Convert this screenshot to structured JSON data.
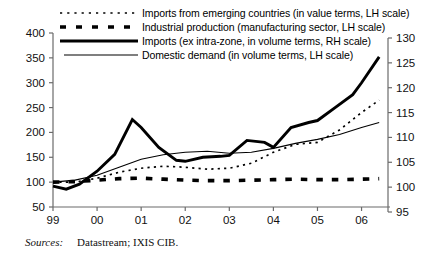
{
  "figure": {
    "source_label": "Sources:",
    "source_value": "Datastream; IXIS CIB."
  },
  "legend": {
    "items": [
      {
        "style": "dotted",
        "label": "Imports from emerging countries (in value terms, LH scale)"
      },
      {
        "style": "dashed",
        "label": "Industrial production (manufacturing sector, LH scale)"
      },
      {
        "style": "thick-solid",
        "label": "Imports (ex intra-zone, in volume terms, RH scale)"
      },
      {
        "style": "thin-solid",
        "label": "Domestic demand (in volume terms, LH scale)"
      }
    ]
  },
  "chart_data": {
    "type": "line",
    "title": "",
    "xlabel": "",
    "ylabel": "",
    "grid": false,
    "legend_position": "top",
    "x_ticks": [
      "99",
      "00",
      "01",
      "02",
      "03",
      "04",
      "05",
      "06"
    ],
    "x_tick_values": [
      1999,
      2000,
      2001,
      2002,
      2003,
      2004,
      2005,
      2006
    ],
    "xlim": [
      1999,
      2006.6
    ],
    "left_axis": {
      "label": "LH scale",
      "ylim": [
        50,
        400
      ],
      "ticks": [
        50,
        100,
        150,
        200,
        250,
        300,
        350,
        400
      ]
    },
    "right_axis": {
      "label": "RH scale",
      "ylim": [
        95,
        130
      ],
      "ticks": [
        95,
        100,
        105,
        110,
        115,
        120,
        125,
        130
      ]
    },
    "series": [
      {
        "name": "Imports from emerging countries (in value terms, LH scale)",
        "axis": "left",
        "style": "dotted",
        "x": [
          1999.0,
          1999.5,
          2000.0,
          2000.5,
          2001.0,
          2001.5,
          2002.0,
          2002.5,
          2003.0,
          2003.5,
          2004.0,
          2004.5,
          2005.0,
          2005.5,
          2006.0,
          2006.4
        ],
        "values": [
          100,
          100,
          108,
          120,
          128,
          132,
          130,
          126,
          128,
          138,
          160,
          176,
          180,
          205,
          240,
          265
        ]
      },
      {
        "name": "Industrial production (manufacturing sector, LH scale)",
        "axis": "left",
        "style": "dashed",
        "x": [
          1999.0,
          1999.5,
          2000.0,
          2000.5,
          2001.0,
          2001.5,
          2002.0,
          2002.5,
          2003.0,
          2003.5,
          2004.0,
          2004.5,
          2005.0,
          2005.5,
          2006.0,
          2006.4
        ],
        "values": [
          100,
          101,
          104,
          107,
          108,
          106,
          104,
          103,
          103,
          104,
          105,
          106,
          105,
          105,
          106,
          107
        ]
      },
      {
        "name": "Imports (ex intra-zone, in volume terms, RH scale)",
        "axis": "right",
        "style": "thick-solid",
        "x": [
          1999.0,
          1999.3,
          1999.6,
          2000.0,
          2000.4,
          2000.8,
          2001.0,
          2001.4,
          2001.8,
          2002.0,
          2002.4,
          2002.8,
          2003.0,
          2003.4,
          2003.8,
          2004.0,
          2004.4,
          2004.8,
          2005.0,
          2005.4,
          2005.8,
          2006.0,
          2006.4
        ],
        "values": [
          100.2,
          99.6,
          100.6,
          103.2,
          106.6,
          113.6,
          112.0,
          108.0,
          105.4,
          105.2,
          106.0,
          106.2,
          106.4,
          109.4,
          109.0,
          108.0,
          112.0,
          113.0,
          113.4,
          116.0,
          118.6,
          121.0,
          126.2
        ]
      },
      {
        "name": "Domestic demand (in volume terms, LH scale)",
        "axis": "left",
        "style": "thin-solid",
        "x": [
          1999.0,
          1999.5,
          2000.0,
          2000.5,
          2001.0,
          2001.5,
          2002.0,
          2002.5,
          2003.0,
          2003.5,
          2004.0,
          2004.5,
          2005.0,
          2005.5,
          2006.0,
          2006.4
        ],
        "values": [
          100,
          104,
          114,
          130,
          146,
          155,
          160,
          162,
          158,
          160,
          168,
          178,
          186,
          196,
          210,
          220
        ]
      }
    ]
  }
}
